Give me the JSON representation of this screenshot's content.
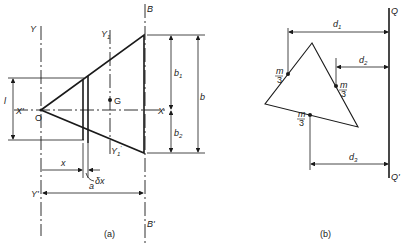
{
  "figure_a": {
    "caption": "(a)",
    "labels": {
      "Y": "Y",
      "Y_prime": "Y'",
      "Y1": "Y",
      "Y1_sub": "1",
      "Y1p": "Y",
      "Y1p_sub": "1",
      "Y1p_mark": "'",
      "B": "B",
      "B_prime": "B'",
      "X": "X",
      "X_prime": "X'",
      "O": "O",
      "G": "G",
      "l": "l",
      "x": "x",
      "dx": "δx",
      "a": "a",
      "b": "b",
      "b1": "b",
      "b1_sub": "1",
      "b2": "b",
      "b2_sub": "2"
    }
  },
  "figure_b": {
    "caption": "(b)",
    "labels": {
      "Q": "Q",
      "Q_prime": "Q'",
      "d1": "d",
      "d1_sub": "1",
      "d2": "d",
      "d2_sub": "2",
      "d3": "d",
      "d3_sub": "3",
      "m": "m",
      "three": "3"
    }
  }
}
